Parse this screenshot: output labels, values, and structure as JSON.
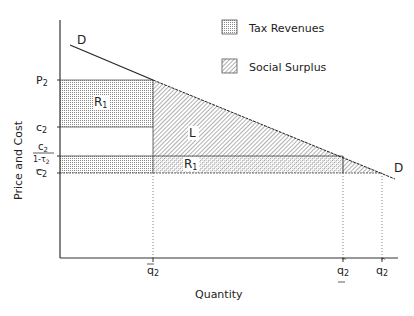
{
  "legend": {
    "items": [
      {
        "label": "Tax Revenues",
        "pattern": "dots"
      },
      {
        "label": "Social Surplus",
        "pattern": "hatch"
      }
    ]
  },
  "axes": {
    "x_label": "Quantity",
    "y_label": "Price and Cost"
  },
  "y_ticks": {
    "p2": "P",
    "p2_sub": "2",
    "c2_upper": "c",
    "c2_upper_sub": "2",
    "ratio_num": "c",
    "ratio_num_sub": "2",
    "ratio_den": "1-τ",
    "ratio_den_sub": "2",
    "c2_lower": "c",
    "c2_lower_sub": "2"
  },
  "x_ticks": {
    "qbar": "q",
    "qbar_sub": "2",
    "qunder": "q",
    "qunder_sub": "2",
    "qhat": "q",
    "qhat_sub": "2"
  },
  "region_labels": {
    "r1_upper": "R",
    "r1_upper_sub": "1",
    "l": "L",
    "r1_lower": "R",
    "r1_lower_sub": "1"
  },
  "curve_labels": {
    "demand_left": "D",
    "demand_right": "D"
  },
  "colors": {
    "line": "#222222",
    "dot": "#7a7a7a",
    "hatch": "#6a6a6a"
  }
}
